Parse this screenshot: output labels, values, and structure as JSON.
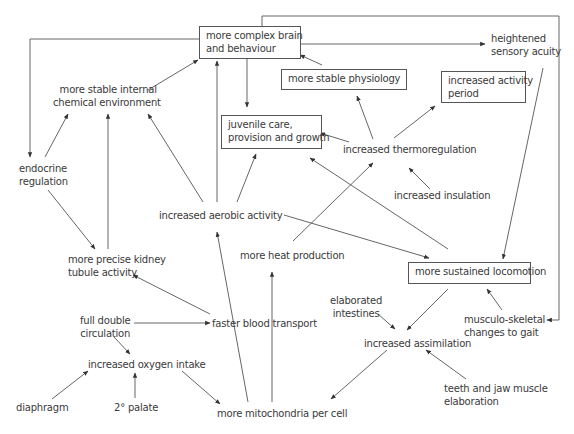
{
  "diagram": {
    "type": "concept-map",
    "nodes": [
      {
        "id": "brain",
        "label_line1": "more complex brain",
        "label_line2": "and behaviour",
        "boxed": true
      },
      {
        "id": "sensory",
        "label_line1": "heightened",
        "label_line2": "sensory acuity",
        "boxed": false
      },
      {
        "id": "chem",
        "label_line1": "more stable internal",
        "label_line2": "chemical environment",
        "boxed": false
      },
      {
        "id": "physio",
        "label_line1": "more stable physiology",
        "boxed": true
      },
      {
        "id": "activity_period",
        "label_line1": "increased activity",
        "label_line2": "period",
        "boxed": true
      },
      {
        "id": "juvenile",
        "label_line1": "juvenile care,",
        "label_line2": "provision and growth",
        "boxed": true
      },
      {
        "id": "thermo",
        "label_line1": "increased thermoregulation",
        "boxed": false
      },
      {
        "id": "endocrine",
        "label_line1": "endocrine",
        "label_line2": "regulation",
        "boxed": false
      },
      {
        "id": "insulation",
        "label_line1": "increased insulation",
        "boxed": false
      },
      {
        "id": "aerobic",
        "label_line1": "increased aerobic activity",
        "boxed": false
      },
      {
        "id": "kidney",
        "label_line1": "more precise kidney",
        "label_line2": "tubule activity",
        "boxed": false
      },
      {
        "id": "heat",
        "label_line1": "more heat production",
        "boxed": false
      },
      {
        "id": "locomotion",
        "label_line1": "more sustained locomotion",
        "boxed": true
      },
      {
        "id": "double_circ",
        "label_line1": "full double",
        "label_line2": "circulation",
        "boxed": false
      },
      {
        "id": "blood",
        "label_line1": "faster blood transport",
        "boxed": false
      },
      {
        "id": "intestines",
        "label_line1": "elaborated",
        "label_line2": "intestines",
        "boxed": false
      },
      {
        "id": "gait",
        "label_line1": "musculo-skeletal",
        "label_line2": "changes to gait",
        "boxed": false
      },
      {
        "id": "oxygen",
        "label_line1": "increased oxygen intake",
        "boxed": false
      },
      {
        "id": "assimilation",
        "label_line1": "increased assimilation",
        "boxed": false
      },
      {
        "id": "teeth",
        "label_line1": "teeth and jaw muscle",
        "label_line2": "elaboration",
        "boxed": false
      },
      {
        "id": "diaphragm",
        "label_line1": "diaphragm",
        "boxed": false
      },
      {
        "id": "palate",
        "label_line1": "2° palate",
        "boxed": false
      },
      {
        "id": "mito",
        "label_line1": "more mitochondria per cell",
        "boxed": false
      }
    ],
    "edges": [
      {
        "from": "brain",
        "to": "endocrine"
      },
      {
        "from": "brain",
        "to": "sensory"
      },
      {
        "from": "brain",
        "to": "gait"
      },
      {
        "from": "brain",
        "to": "juvenile"
      },
      {
        "from": "chem",
        "to": "brain"
      },
      {
        "from": "physio",
        "to": "brain"
      },
      {
        "from": "aerobic",
        "to": "brain"
      },
      {
        "from": "aerobic",
        "to": "chem"
      },
      {
        "from": "aerobic",
        "to": "juvenile"
      },
      {
        "from": "aerobic",
        "to": "locomotion"
      },
      {
        "from": "endocrine",
        "to": "chem"
      },
      {
        "from": "endocrine",
        "to": "kidney"
      },
      {
        "from": "kidney",
        "to": "chem"
      },
      {
        "from": "thermo",
        "to": "physio"
      },
      {
        "from": "thermo",
        "to": "activity_period"
      },
      {
        "from": "thermo",
        "to": "juvenile"
      },
      {
        "from": "insulation",
        "to": "thermo"
      },
      {
        "from": "heat",
        "to": "thermo"
      },
      {
        "from": "locomotion",
        "to": "juvenile"
      },
      {
        "from": "sensory",
        "to": "locomotion"
      },
      {
        "from": "locomotion",
        "to": "assimilation"
      },
      {
        "from": "gait",
        "to": "locomotion"
      },
      {
        "from": "intestines",
        "to": "assimilation"
      },
      {
        "from": "teeth",
        "to": "assimilation"
      },
      {
        "from": "assimilation",
        "to": "mito"
      },
      {
        "from": "blood",
        "to": "kidney"
      },
      {
        "from": "double_circ",
        "to": "blood"
      },
      {
        "from": "double_circ",
        "to": "oxygen"
      },
      {
        "from": "diaphragm",
        "to": "oxygen"
      },
      {
        "from": "palate",
        "to": "oxygen"
      },
      {
        "from": "oxygen",
        "to": "mito"
      },
      {
        "from": "mito",
        "to": "aerobic"
      },
      {
        "from": "mito",
        "to": "heat"
      }
    ]
  }
}
